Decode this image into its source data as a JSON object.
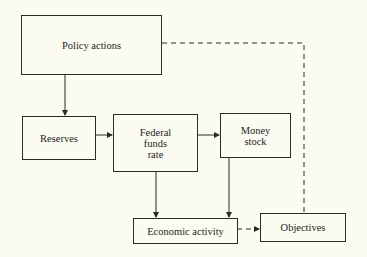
{
  "diagram": {
    "nodes": {
      "policy_actions": {
        "label": "Policy actions"
      },
      "reserves": {
        "label": "Reserves"
      },
      "federal_funds_rate": {
        "line1": "Federal",
        "line2": "funds",
        "line3": "rate"
      },
      "money_stock": {
        "line1": "Money",
        "line2": "stock"
      },
      "economic_activity": {
        "label": "Economic activity"
      },
      "objectives": {
        "label": "Objectives"
      }
    },
    "edges": [
      {
        "from": "Policy actions",
        "to": "Reserves",
        "style": "solid"
      },
      {
        "from": "Reserves",
        "to": "Federal funds rate",
        "style": "solid"
      },
      {
        "from": "Federal funds rate",
        "to": "Money stock",
        "style": "solid"
      },
      {
        "from": "Federal funds rate",
        "to": "Economic activity",
        "style": "solid"
      },
      {
        "from": "Money stock",
        "to": "Economic activity",
        "style": "solid"
      },
      {
        "from": "Economic activity",
        "to": "Objectives",
        "style": "dashed"
      },
      {
        "from": "Policy actions",
        "to": "Objectives",
        "style": "dashed"
      }
    ],
    "colors": {
      "background": "#fbfbf1",
      "stroke": "#2a2a2a",
      "text": "#1e1e1e"
    }
  }
}
